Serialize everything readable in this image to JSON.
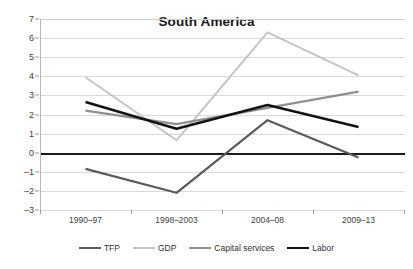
{
  "chart_data": {
    "type": "line",
    "title": "South America",
    "xlabel": "",
    "ylabel": "",
    "categories": [
      "1990–97",
      "1998–2003",
      "2004–08",
      "2009–13"
    ],
    "ylim": [
      -3,
      7
    ],
    "ytick_labels": [
      "7",
      "6",
      "5",
      "4",
      "3",
      "2",
      "1",
      "0",
      "–1",
      "–2",
      "–3"
    ],
    "ytick_values": [
      7,
      6,
      5,
      4,
      3,
      2,
      1,
      0,
      -1,
      -2,
      -3
    ],
    "grid": "horizontal",
    "legend_position": "bottom",
    "zero_line": true,
    "series": [
      {
        "name": "TFP",
        "color": "#5a5a5a",
        "width": 2.2,
        "values": [
          -0.85,
          -2.1,
          1.7,
          -0.25
        ]
      },
      {
        "name": "GDP",
        "color": "#c4c4c4",
        "width": 2.0,
        "values": [
          3.95,
          0.65,
          6.3,
          4.05
        ]
      },
      {
        "name": "Capital services",
        "color": "#8f8f8f",
        "width": 2.2,
        "values": [
          2.2,
          1.5,
          2.35,
          3.2
        ]
      },
      {
        "name": "Labor",
        "color": "#131313",
        "width": 2.6,
        "values": [
          2.65,
          1.25,
          2.5,
          1.35
        ]
      }
    ]
  },
  "axis": {
    "grid_color": "#d9d9d9",
    "axis_color": "#b8b8b8",
    "zero_color": "#1a1a1a"
  }
}
